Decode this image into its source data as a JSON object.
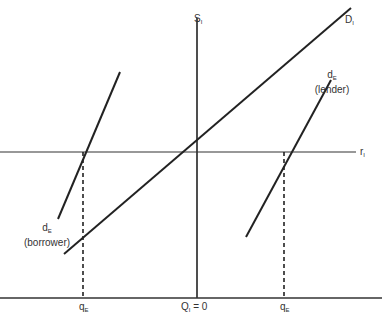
{
  "diagram": {
    "type": "supply-demand",
    "labels": {
      "supply": {
        "main": "S",
        "sub": "I"
      },
      "demand": {
        "main": "D",
        "sub": "I"
      },
      "rate": {
        "main": "r",
        "sub": "I"
      },
      "lender": {
        "main": "d",
        "sub": "E",
        "note": "(lender)"
      },
      "borrower": {
        "main": "d",
        "sub": "E",
        "note": "(borrower)"
      },
      "q_left": {
        "main": "q",
        "sub": "E"
      },
      "q_center": {
        "main": "Q",
        "sub": "I",
        "suffix": " = 0"
      },
      "q_right": {
        "main": "q",
        "sub": "E"
      }
    },
    "colors": {
      "line": "#222222",
      "text": "#333333",
      "background": "#ffffff"
    }
  }
}
